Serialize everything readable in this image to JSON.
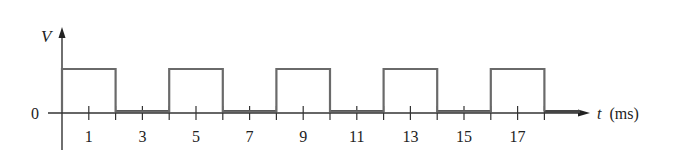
{
  "chart_data": {
    "type": "line",
    "title": "",
    "xlabel": "t (ms)",
    "ylabel": "V",
    "x_label_var": "t",
    "x_label_unit": "(ms)",
    "y_zero_label": "0",
    "xlim": [
      0,
      19.6
    ],
    "tick_positions": [
      1,
      2,
      3,
      4,
      5,
      6,
      7,
      8,
      9,
      10,
      11,
      12,
      13,
      14,
      15,
      16,
      17,
      18
    ],
    "tick_labels": [
      {
        "x": 1,
        "label": "1"
      },
      {
        "x": 3,
        "label": "3"
      },
      {
        "x": 5,
        "label": "5"
      },
      {
        "x": 7,
        "label": "7"
      },
      {
        "x": 9,
        "label": "9"
      },
      {
        "x": 11,
        "label": "11"
      },
      {
        "x": 13,
        "label": "13"
      },
      {
        "x": 15,
        "label": "15"
      },
      {
        "x": 17,
        "label": "17"
      }
    ],
    "grid": false,
    "series": [
      {
        "name": "square wave",
        "description": "Square pulse train, period 4 ms, 50% duty cycle, high from 0-2, 4-6, 8-10, 12-14, 16-18 ms",
        "x": [
          0,
          0,
          2,
          2,
          4,
          4,
          6,
          6,
          8,
          8,
          10,
          10,
          12,
          12,
          14,
          14,
          16,
          16,
          18,
          18
        ],
        "values": [
          0,
          1,
          1,
          0,
          0,
          1,
          1,
          0,
          0,
          1,
          1,
          0,
          0,
          1,
          1,
          0,
          0,
          1,
          1,
          0
        ]
      }
    ],
    "pulses": [
      [
        0,
        2
      ],
      [
        4,
        6
      ],
      [
        8,
        10
      ],
      [
        12,
        14
      ],
      [
        16,
        18
      ]
    ],
    "high_level": 1,
    "low_level": 0
  }
}
